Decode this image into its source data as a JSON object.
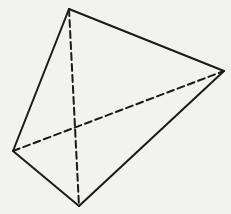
{
  "diagram": {
    "type": "tetrahedron",
    "background": "#f2f2f0",
    "stroke_color": "#1a1a1a",
    "stroke_width": 2,
    "dash_pattern": "7 4",
    "vertices": {
      "A": {
        "x": 69,
        "y": 9
      },
      "B": {
        "x": 224,
        "y": 71
      },
      "C": {
        "x": 13,
        "y": 151
      },
      "D": {
        "x": 79,
        "y": 206
      }
    },
    "solid_edges": [
      [
        "A",
        "B"
      ],
      [
        "B",
        "D"
      ],
      [
        "D",
        "C"
      ],
      [
        "C",
        "A"
      ]
    ],
    "dashed_edges": [
      [
        "A",
        "D"
      ],
      [
        "C",
        "B"
      ]
    ]
  }
}
